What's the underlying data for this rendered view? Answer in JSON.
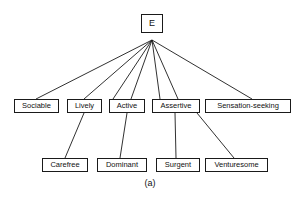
{
  "figure": {
    "caption": "(a)",
    "root_label": "E",
    "stroke_color": "#1a1a1a",
    "text_color": "#111111",
    "background_color": "#ffffff"
  },
  "nodes": {
    "root": {
      "label": "E",
      "x": 141,
      "y": 14,
      "w": 22,
      "h": 19,
      "font_size": 9
    },
    "level2": [
      {
        "label": "Sociable",
        "x": 14,
        "y": 99,
        "w": 45,
        "h": 14,
        "font_size": 7.5
      },
      {
        "label": "Lively",
        "x": 67,
        "y": 99,
        "w": 35,
        "h": 14,
        "font_size": 7.5
      },
      {
        "label": "Active",
        "x": 109,
        "y": 99,
        "w": 36,
        "h": 14,
        "font_size": 7.5
      },
      {
        "label": "Assertive",
        "x": 152,
        "y": 99,
        "w": 48,
        "h": 14,
        "font_size": 7.5
      },
      {
        "label": "Sensation-seeking",
        "x": 205,
        "y": 99,
        "w": 86,
        "h": 14,
        "font_size": 7.5
      }
    ],
    "level3": [
      {
        "label": "Carefree",
        "x": 42,
        "y": 158,
        "w": 46,
        "h": 14,
        "font_size": 7.5
      },
      {
        "label": "Dominant",
        "x": 97,
        "y": 158,
        "w": 50,
        "h": 14,
        "font_size": 7.5
      },
      {
        "label": "Surgent",
        "x": 156,
        "y": 158,
        "w": 44,
        "h": 14,
        "font_size": 7.5
      },
      {
        "label": "Venturesome",
        "x": 205,
        "y": 158,
        "w": 63,
        "h": 14,
        "font_size": 7.5
      }
    ]
  },
  "edges": {
    "from_root": [
      {
        "from": "E",
        "to": "Sociable",
        "x1": 152,
        "y1": 40,
        "x2": 36,
        "y2": 99
      },
      {
        "from": "E",
        "to": "Lively",
        "x1": 152,
        "y1": 40,
        "x2": 84,
        "y2": 99
      },
      {
        "from": "E",
        "to": "Active",
        "x1": 152,
        "y1": 40,
        "x2": 113,
        "y2": 99
      },
      {
        "from": "E",
        "to": "Active",
        "x1": 152,
        "y1": 40,
        "x2": 131,
        "y2": 99
      },
      {
        "from": "E",
        "to": "Assertive",
        "x1": 152,
        "y1": 40,
        "x2": 160,
        "y2": 99
      },
      {
        "from": "E",
        "to": "Assertive",
        "x1": 152,
        "y1": 40,
        "x2": 178,
        "y2": 99
      },
      {
        "from": "E",
        "to": "Sensation-seeking",
        "x1": 152,
        "y1": 40,
        "x2": 252,
        "y2": 99
      }
    ],
    "from_level2": [
      {
        "from": "Lively",
        "to": "Carefree",
        "x1": 84,
        "y1": 113,
        "x2": 65,
        "y2": 158
      },
      {
        "from": "Active",
        "to": "Dominant",
        "x1": 127,
        "y1": 113,
        "x2": 120,
        "y2": 158
      },
      {
        "from": "Assertive",
        "to": "Surgent",
        "x1": 175,
        "y1": 113,
        "x2": 176,
        "y2": 158
      },
      {
        "from": "Assertive",
        "to": "Venturesome",
        "x1": 197,
        "y1": 113,
        "x2": 234,
        "y2": 158
      }
    ]
  },
  "caption_box": {
    "x": 120,
    "y": 178,
    "w": 60,
    "h": 14,
    "font_size": 9
  }
}
